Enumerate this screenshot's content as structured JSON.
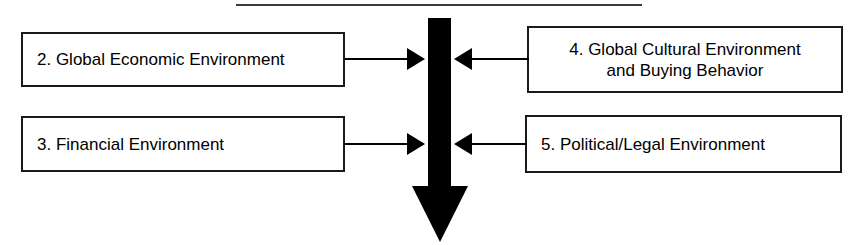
{
  "diagram": {
    "top_rule": "horizontal-rule",
    "colors": {
      "stroke": "#000000",
      "box_border": "#1a1a1a",
      "background": "#ffffff",
      "rule": "#3a3a3a"
    },
    "nodes": [
      {
        "id": "economic",
        "label": "2. Global Economic Environment",
        "side": "left",
        "row": "top"
      },
      {
        "id": "financial",
        "label": "3. Financial Environment",
        "side": "left",
        "row": "bottom"
      },
      {
        "id": "cultural",
        "label": "4. Global Cultural Environment\nand Buying Behavior",
        "side": "right",
        "row": "top"
      },
      {
        "id": "political",
        "label": "5. Political/Legal Environment",
        "side": "right",
        "row": "bottom"
      }
    ],
    "connectors": [
      {
        "id": "economic-to-flow",
        "from": "economic",
        "to": "main-flow",
        "direction": "right"
      },
      {
        "id": "financial-to-flow",
        "from": "financial",
        "to": "main-flow",
        "direction": "right"
      },
      {
        "id": "cultural-to-flow",
        "from": "cultural",
        "to": "main-flow",
        "direction": "left"
      },
      {
        "id": "political-to-flow",
        "from": "political",
        "to": "main-flow",
        "direction": "left"
      }
    ],
    "main_flow": {
      "id": "main-flow",
      "shape": "thick-down-arrow",
      "direction": "down",
      "label": ""
    }
  }
}
